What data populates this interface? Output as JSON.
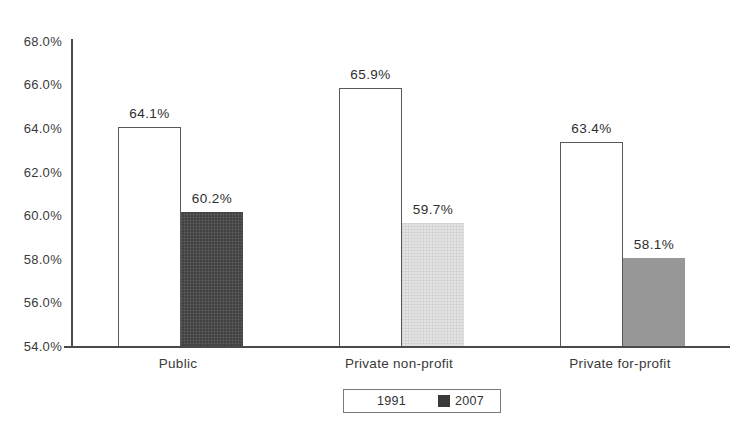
{
  "window": {
    "width": 748,
    "height": 424,
    "background": "#ffffff"
  },
  "chart_data": {
    "type": "bar",
    "title": "",
    "xlabel": "",
    "ylabel": "",
    "categories": [
      "Public",
      "Private non-profit",
      "Private for-profit"
    ],
    "series": [
      {
        "name": "1991",
        "values": [
          64.1,
          65.9,
          63.4
        ],
        "value_labels": [
          "64.1%",
          "65.9%",
          "63.4%"
        ],
        "fill": "#ffffff",
        "border": "#585858"
      },
      {
        "name": "2007",
        "values": [
          60.2,
          59.7,
          58.1
        ],
        "value_labels": [
          "60.2%",
          "59.7%",
          "58.1%"
        ],
        "fills": [
          "#414141",
          "#e3e3e3",
          "#979797"
        ],
        "textures": [
          "crosshatch-dark",
          "crosshatch-light",
          "plain"
        ]
      }
    ],
    "ylim": [
      54.0,
      68.0
    ],
    "ytick_step": 2.0,
    "ytick_labels": [
      "54.0%",
      "56.0%",
      "58.0%",
      "60.0%",
      "62.0%",
      "64.0%",
      "66.0%",
      "68.0%"
    ],
    "grid": false,
    "legend_position": "bottom-center"
  },
  "legend": {
    "items": [
      {
        "label": "1991",
        "swatch_color": "#ffffff",
        "swatch_border": "#ffffff"
      },
      {
        "label": "2007",
        "swatch_color": "#3a3a3a",
        "swatch_border": "#3a3a3a"
      }
    ]
  },
  "colors": {
    "axis": "#4a4a4a",
    "text": "#333333",
    "legend_border": "#7a7a7a"
  }
}
